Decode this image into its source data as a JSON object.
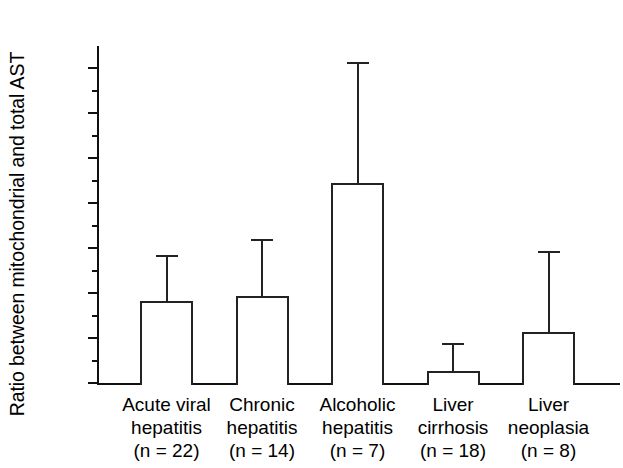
{
  "chart_data": {
    "type": "bar",
    "title": "",
    "xlabel": "",
    "ylabel": "Ratio between mitochondrial and total AST",
    "ylim": [
      0.0,
      0.28
    ],
    "ytick_step": 0.04,
    "minor_tick_step": 0.02,
    "grid": false,
    "legend": null,
    "error_bars": "upper only (SD)",
    "ytick_labels": [
      "0.00",
      "0.04",
      "0.08",
      "0.12",
      "0.16",
      "0.20",
      "0.24",
      "0.28"
    ],
    "ytick_values": [
      0.0,
      0.04,
      0.08,
      0.12,
      0.16,
      0.2,
      0.24,
      0.28
    ],
    "categories": [
      "Acute viral hepatitis (n = 22)",
      "Chronic hepatitis (n = 14)",
      "Alcoholic hepatitis (n = 7)",
      "Liver cirrhosis (n = 18)",
      "Liver neoplasia (n = 8)"
    ],
    "values": [
      0.073,
      0.077,
      0.178,
      0.011,
      0.045
    ],
    "error_upper": [
      0.114,
      0.128,
      0.285,
      0.036,
      0.117
    ],
    "n": [
      22,
      14,
      7,
      18,
      8
    ],
    "series": [
      {
        "name": "Ratio between mitochondrial and total AST",
        "values": [
          0.073,
          0.077,
          0.178,
          0.011,
          0.045
        ],
        "error_upper": [
          0.114,
          0.128,
          0.285,
          0.036,
          0.117
        ]
      }
    ]
  },
  "xcats": [
    {
      "l1": "Acute viral",
      "l2": "hepatitis",
      "l3": "(n = 22)"
    },
    {
      "l1": "Chronic",
      "l2": "hepatitis",
      "l3": "(n = 14)"
    },
    {
      "l1": "Alcoholic",
      "l2": "hepatitis",
      "l3": "(n = 7)"
    },
    {
      "l1": "Liver",
      "l2": "cirrhosis",
      "l3": "(n = 18)"
    },
    {
      "l1": "Liver",
      "l2": "neoplasia",
      "l3": "(n = 8)"
    }
  ]
}
